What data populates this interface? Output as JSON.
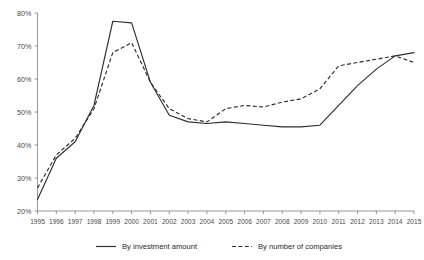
{
  "chart_data": {
    "type": "line",
    "title": "",
    "xlabel": "",
    "ylabel": "",
    "grid": false,
    "legend_position": "bottom",
    "x": [
      1995,
      1996,
      1997,
      1998,
      1999,
      2000,
      2001,
      2002,
      2003,
      2004,
      2005,
      2006,
      2007,
      2008,
      2009,
      2010,
      2011,
      2012,
      2013,
      2014,
      2015
    ],
    "categories": [
      "1995",
      "1996",
      "1997",
      "1998",
      "1999",
      "2000",
      "2001",
      "2002",
      "2003",
      "2004",
      "2005",
      "2006",
      "2007",
      "2008",
      "2009",
      "2010",
      "2011",
      "2012",
      "2013",
      "2014",
      "2015"
    ],
    "ylim": [
      20,
      80
    ],
    "xlim": [
      1995,
      2015
    ],
    "y_ticks": [
      20,
      30,
      40,
      50,
      60,
      70,
      80
    ],
    "y_tick_labels": [
      "20%",
      "30%",
      "40%",
      "50%",
      "60%",
      "70%",
      "80%"
    ],
    "series": [
      {
        "name": "By investment amount",
        "style": "solid",
        "color": "#2e2e2e",
        "values": [
          23.5,
          36.0,
          41.0,
          52.0,
          77.5,
          77.0,
          59.0,
          49.0,
          47.0,
          46.5,
          47.0,
          46.5,
          46.0,
          45.5,
          45.5,
          46.0,
          52.0,
          58.0,
          63.0,
          67.0,
          68.0
        ]
      },
      {
        "name": "By number of companies",
        "style": "dashed",
        "color": "#2e2e2e",
        "values": [
          27.0,
          37.0,
          42.0,
          51.0,
          68.0,
          71.0,
          59.0,
          51.0,
          48.0,
          47.0,
          51.0,
          52.0,
          51.5,
          53.0,
          54.0,
          57.0,
          64.0,
          65.0,
          66.0,
          67.0,
          65.0
        ]
      }
    ]
  },
  "legend": {
    "items": [
      {
        "label": "By investment amount",
        "style": "solid"
      },
      {
        "label": "By number of companies",
        "style": "dashed"
      }
    ]
  }
}
